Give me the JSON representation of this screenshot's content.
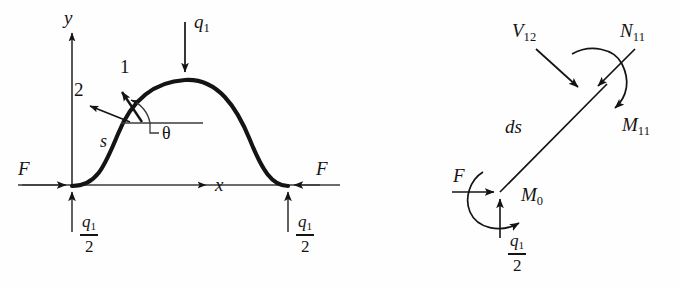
{
  "figure": {
    "background_color": "#fefefe",
    "ink_color": "#141414",
    "thin_line_color": "#3a3a3a"
  },
  "left_panel": {
    "name": "arch-global-free-body",
    "axes": {
      "x_label": "x",
      "y_label": "y"
    },
    "load": {
      "label_base": "q",
      "label_sub": "1",
      "direction": "down"
    },
    "local_axes": {
      "tangent_label": "1",
      "normal_label": "2",
      "arclength_label": "s",
      "angle_label": "θ"
    },
    "left_support": {
      "horizontal_force_label": "F",
      "vertical_reaction_num": "q",
      "vertical_reaction_num_sub": "1",
      "vertical_reaction_den": "2"
    },
    "right_support": {
      "horizontal_force_label": "F",
      "vertical_reaction_num": "q",
      "vertical_reaction_num_sub": "1",
      "vertical_reaction_den": "2"
    }
  },
  "right_panel": {
    "name": "differential-element-free-body",
    "element_label": "ds",
    "upper_node": {
      "shear_label_base": "V",
      "shear_label_sub": "12",
      "normal_label_base": "N",
      "normal_label_sub": "11",
      "moment_label_base": "M",
      "moment_label_sub": "11"
    },
    "lower_node": {
      "horizontal_force_label": "F",
      "moment_label_base": "M",
      "moment_label_sub": "0",
      "vertical_reaction_num": "q",
      "vertical_reaction_num_sub": "1",
      "vertical_reaction_den": "2"
    }
  }
}
